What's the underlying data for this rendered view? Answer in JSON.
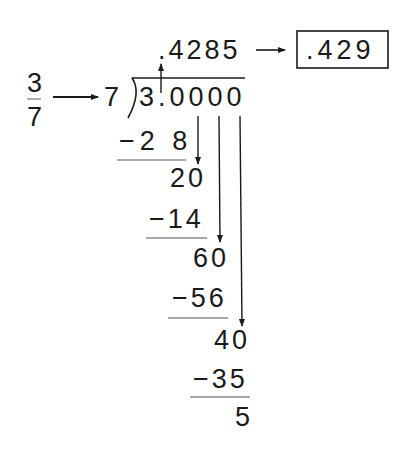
{
  "fraction": {
    "numerator": "3",
    "denominator": "7"
  },
  "divisor": "7",
  "dividend": "3.0000",
  "quotient": ".4285",
  "rounded_result": ".429",
  "steps": [
    {
      "subtract": "−2 8"
    },
    {
      "remainder": "20"
    },
    {
      "subtract": "−14"
    },
    {
      "remainder": "60"
    },
    {
      "subtract": "−56"
    },
    {
      "remainder": "40"
    },
    {
      "subtract": "−35"
    },
    {
      "remainder": "5"
    }
  ],
  "colors": {
    "ink": "#1a1a1a",
    "rule": "#555555"
  }
}
